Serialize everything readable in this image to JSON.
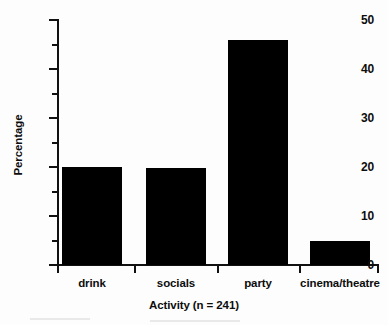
{
  "chart_data": {
    "type": "bar",
    "title": "",
    "categories": [
      "drink",
      "socials",
      "party",
      "cinema/theatre"
    ],
    "values": [
      20,
      19.8,
      46,
      5
    ],
    "xlabel": "Activity (n = 241)",
    "ylabel": "Percentage",
    "ylim": [
      0,
      50
    ],
    "y_major_ticks": [
      0,
      10,
      20,
      30,
      40,
      50
    ],
    "y_minor_ticks": [
      5,
      15,
      25,
      35,
      45
    ],
    "y_tick_labels": [
      "0",
      "10",
      "20",
      "30",
      "40",
      "50"
    ],
    "grid": false,
    "legend": false,
    "legend_position": "none",
    "bar_color": "#000000",
    "axis_color": "#111111"
  },
  "axis": {
    "y_labels": [
      {
        "value": 50,
        "text": "50"
      },
      {
        "value": 40,
        "text": "40"
      },
      {
        "value": 30,
        "text": "30"
      },
      {
        "value": 20,
        "text": "20"
      },
      {
        "value": 10,
        "text": "10"
      },
      {
        "value": 0,
        "text": "0"
      }
    ],
    "x_title": "Activity (n = 241)",
    "y_title": "Percentage"
  },
  "bars": [
    {
      "label": "drink",
      "value": 20
    },
    {
      "label": "socials",
      "value": 19.8
    },
    {
      "label": "party",
      "value": 46
    },
    {
      "label": "cinema/theatre",
      "value": 5
    }
  ]
}
